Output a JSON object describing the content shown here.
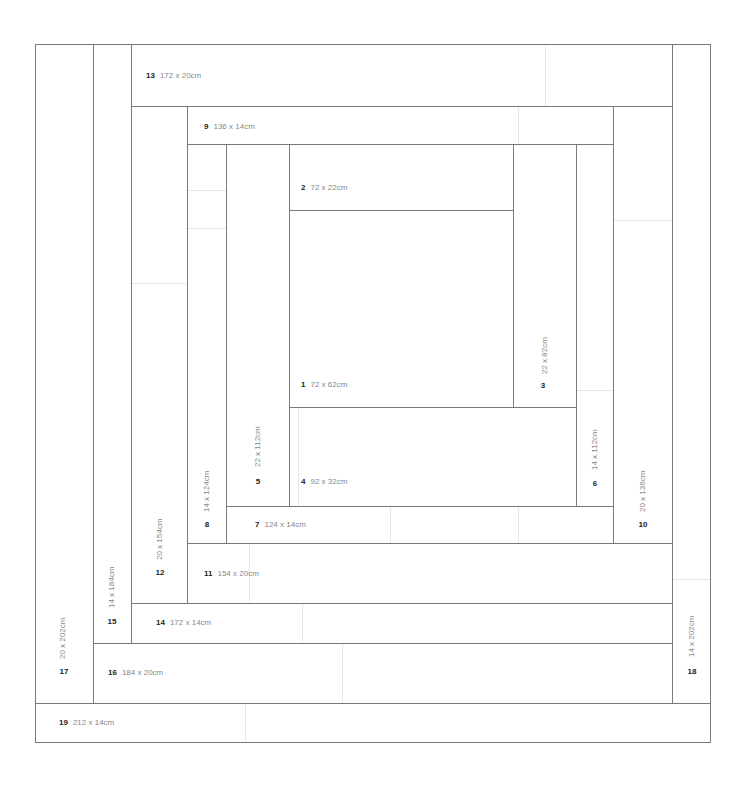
{
  "diagram": {
    "type": "log-cabin quilt/rug layout",
    "line_color": "#7a7a7a",
    "seam_color": "#e6e6e6",
    "pieces": [
      {
        "id": "1",
        "label": "72 x 62cm",
        "orientation": "horizontal"
      },
      {
        "id": "2",
        "label": "72 x 22cm",
        "orientation": "horizontal"
      },
      {
        "id": "3",
        "label": "22 x 82cm",
        "orientation": "vertical"
      },
      {
        "id": "4",
        "label": "92 x 32cm",
        "orientation": "horizontal"
      },
      {
        "id": "5",
        "label": "22 x 112cm",
        "orientation": "vertical"
      },
      {
        "id": "6",
        "label": "14 x 112cm",
        "orientation": "vertical"
      },
      {
        "id": "7",
        "label": "124 x 14cm",
        "orientation": "horizontal"
      },
      {
        "id": "8",
        "label": "14 x 124cm",
        "orientation": "vertical"
      },
      {
        "id": "9",
        "label": "136 x 14cm",
        "orientation": "horizontal"
      },
      {
        "id": "10",
        "label": "20 x 136cm",
        "orientation": "vertical"
      },
      {
        "id": "11",
        "label": "154 x 20cm",
        "orientation": "horizontal"
      },
      {
        "id": "12",
        "label": "20 x 154cm",
        "orientation": "vertical"
      },
      {
        "id": "13",
        "label": "172 x 20cm",
        "orientation": "horizontal"
      },
      {
        "id": "14",
        "label": "172 x 14cm",
        "orientation": "horizontal"
      },
      {
        "id": "15",
        "label": "14 x 184cm",
        "orientation": "vertical"
      },
      {
        "id": "16",
        "label": "184 x 20cm",
        "orientation": "horizontal"
      },
      {
        "id": "17",
        "label": "20 x 202cm",
        "orientation": "vertical"
      },
      {
        "id": "18",
        "label": "14 x 202cm",
        "orientation": "vertical"
      },
      {
        "id": "19",
        "label": "212 x 14cm",
        "orientation": "horizontal"
      }
    ]
  }
}
